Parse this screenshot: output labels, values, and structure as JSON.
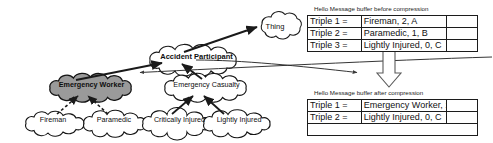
{
  "figure": {
    "type": "ontology-compression-diagram",
    "background": "#ffffff",
    "line_color": "#1a1a1a",
    "highlight_fill": "#9a9a9a"
  },
  "ontology": {
    "nodes": [
      {
        "id": "thing",
        "label": "Thing",
        "shape": "cloud",
        "bold": false,
        "filled": false,
        "x": 248,
        "y": 21,
        "w": 54,
        "h": 20,
        "font_size": 7.5
      },
      {
        "id": "accident-participant",
        "label": "Accident Participant",
        "shape": "cloud",
        "bold": true,
        "filled": false,
        "x": 143,
        "y": 51,
        "w": 107,
        "h": 20,
        "font_size": 7.5
      },
      {
        "id": "emergency-worker",
        "label": "Emergency Worker",
        "shape": "cloud",
        "bold": true,
        "filled": true,
        "x": 42,
        "y": 79,
        "w": 99,
        "h": 19,
        "font_size": 7.2
      },
      {
        "id": "emergency-casualty",
        "label": "Emergency Casualty",
        "shape": "cloud",
        "bold": false,
        "filled": false,
        "x": 157,
        "y": 79,
        "w": 99,
        "h": 19,
        "font_size": 7.2
      },
      {
        "id": "fireman",
        "label": "Fireman",
        "shape": "cloud",
        "bold": false,
        "filled": false,
        "x": 20,
        "y": 114,
        "w": 66,
        "h": 19,
        "font_size": 7.2
      },
      {
        "id": "paramedic",
        "label": "Paramedic",
        "shape": "cloud",
        "bold": false,
        "filled": false,
        "x": 78,
        "y": 114,
        "w": 72,
        "h": 19,
        "font_size": 7.2
      },
      {
        "id": "critically-injured",
        "label": "Critically Injured",
        "shape": "cloud",
        "bold": false,
        "filled": false,
        "x": 137,
        "y": 114,
        "w": 85,
        "h": 19,
        "font_size": 7.2
      },
      {
        "id": "lightly-injured",
        "label": "Lightly Injured",
        "shape": "cloud",
        "bold": false,
        "filled": false,
        "x": 198,
        "y": 114,
        "w": 82,
        "h": 19,
        "font_size": 7.2
      }
    ],
    "edges": [
      {
        "from": "accident-participant",
        "to": "thing",
        "style": "solid"
      },
      {
        "from": "emergency-worker",
        "to": "accident-participant",
        "style": "solid"
      },
      {
        "from": "emergency-casualty",
        "to": "accident-participant",
        "style": "solid"
      },
      {
        "from": "fireman",
        "to": "emergency-worker",
        "style": "dashed"
      },
      {
        "from": "paramedic",
        "to": "emergency-worker",
        "style": "dashed"
      },
      {
        "from": "critically-injured",
        "to": "emergency-casualty",
        "style": "solid"
      },
      {
        "from": "lightly-injured",
        "to": "emergency-casualty",
        "style": "solid"
      }
    ],
    "cross_links": [
      {
        "id": "buffer-to-ontology",
        "direction": "left",
        "note": "curved arrow from buffer area back into ontology"
      },
      {
        "id": "ontology-to-buffer",
        "direction": "right",
        "note": "curved arrow from ontology toward after-compression buffer"
      }
    ]
  },
  "buffers": {
    "before": {
      "caption": "Hello Message buffer before compression",
      "rows": [
        {
          "key": "Triple 1 =",
          "value": "Fireman, 2, A"
        },
        {
          "key": "Triple 2 =",
          "value": "Paramedic, 1, B"
        },
        {
          "key": "Triple 3 =",
          "value": "Lightly Injured, 0, C"
        }
      ]
    },
    "after": {
      "caption": "Hello Message buffer after compression",
      "rows": [
        {
          "key": "Triple 1 =",
          "value": "Emergency Worker, 1, B"
        },
        {
          "key": "Triple 2 =",
          "value": "Lightly Injured, 0, C"
        },
        {
          "key": "",
          "value": ""
        }
      ]
    },
    "transform_arrow": {
      "name": "compression-arrow",
      "direction": "down"
    }
  }
}
